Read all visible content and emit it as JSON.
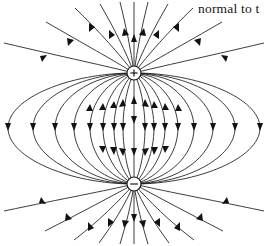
{
  "figure": {
    "title": "",
    "caption_text": "normal to t",
    "background_color": "#ffffff",
    "line_color": "#1a1a1a",
    "width": 266,
    "height": 246
  },
  "poles": {
    "top": {
      "label": "+",
      "symbol_name": "positive-pole",
      "cx": 134,
      "cy": 73,
      "r": 7
    },
    "bottom": {
      "label": "−",
      "symbol_name": "negative-pole",
      "cx": 134,
      "cy": 184,
      "r": 7
    }
  },
  "legend": {
    "field_line_label": "field line",
    "arrow_label": "field direction arrow"
  }
}
